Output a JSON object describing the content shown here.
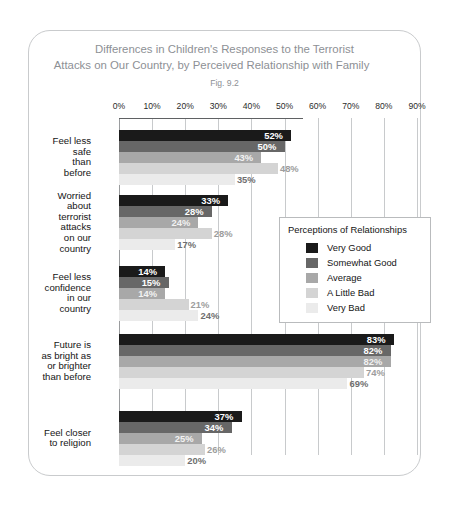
{
  "figure": {
    "title_line_1": "Differences in Children's Responses to the Terrorist",
    "title_line_2": "Attacks on Our Country, by Perceived Relationship with Family",
    "fig_number": "Fig. 9.2"
  },
  "legend": {
    "title": "Perceptions of Relationships",
    "entries": [
      {
        "label": "Very Good",
        "color": "#1a1a1a"
      },
      {
        "label": "Somewhat Good",
        "color": "#676767"
      },
      {
        "label": "Average",
        "color": "#a8a8a8"
      },
      {
        "label": "A Little Bad",
        "color": "#d4d4d4"
      },
      {
        "label": "Very Bad",
        "color": "#ebebeb"
      }
    ]
  },
  "chart_data": {
    "type": "bar",
    "orientation": "horizontal",
    "title": "Differences in Children's Responses to the Terrorist Attacks on Our Country, by Perceived Relationship with Family",
    "subtitle": "Fig. 9.2",
    "xlabel": "",
    "ylabel": "",
    "xlim": [
      0,
      90
    ],
    "xticks": [
      "0%",
      "10%",
      "20%",
      "30%",
      "40%",
      "50%",
      "60%",
      "70%",
      "80%",
      "90%"
    ],
    "xtick_values": [
      0,
      10,
      20,
      30,
      40,
      50,
      60,
      70,
      80,
      90
    ],
    "grid": true,
    "legend_position": "center-right",
    "legend_title": "Perceptions of Relationships",
    "categories": [
      "Feel less\nsafe\nthan\nbefore",
      "Worried\nabout\nterrorist\nattacks\non our\ncountry",
      "Feel less\nconfidence\nin our\ncountry",
      "Future is\nas bright as\nor brighter\nthan before",
      "Feel closer\nto religion"
    ],
    "series": [
      {
        "name": "Very Good",
        "color": "#1a1a1a",
        "values": [
          52,
          33,
          14,
          83,
          37
        ],
        "labels": [
          "52%",
          "33%",
          "14%",
          "83%",
          "37%"
        ]
      },
      {
        "name": "Somewhat Good",
        "color": "#676767",
        "values": [
          50,
          28,
          15,
          82,
          34
        ],
        "labels": [
          "50%",
          "28%",
          "15%",
          "82%",
          "34%"
        ]
      },
      {
        "name": "Average",
        "color": "#a8a8a8",
        "values": [
          43,
          24,
          14,
          82,
          25
        ],
        "labels": [
          "43%",
          "24%",
          "14%",
          "82%",
          "25%"
        ]
      },
      {
        "name": "A Little Bad",
        "color": "#d4d4d4",
        "values": [
          48,
          28,
          21,
          74,
          26
        ],
        "labels": [
          "48%",
          "28%",
          "21%",
          "74%",
          "26%"
        ]
      },
      {
        "name": "Very Bad",
        "color": "#ebebeb",
        "values": [
          35,
          17,
          24,
          69,
          20
        ],
        "labels": [
          "35%",
          "17%",
          "24%",
          "69%",
          "20%"
        ]
      }
    ]
  }
}
